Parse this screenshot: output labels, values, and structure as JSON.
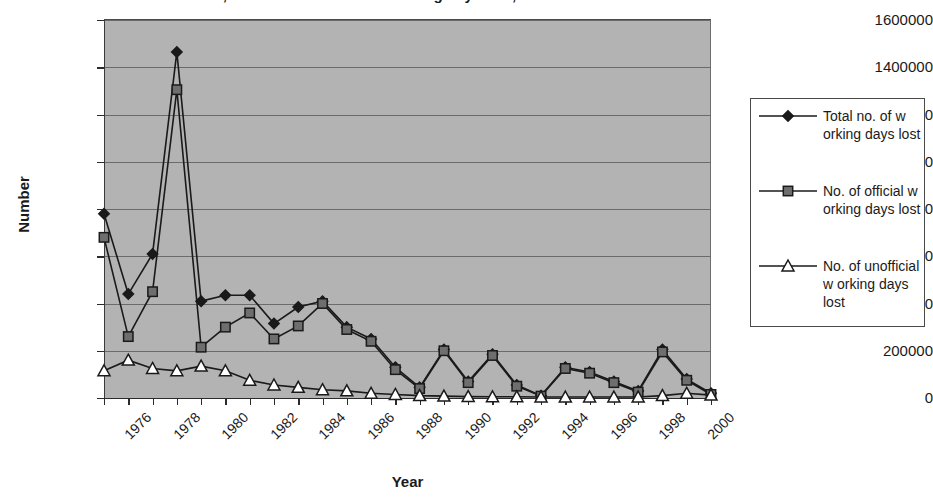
{
  "chart_data": {
    "type": "line",
    "title": "Total, official and unofficial working days lost, 1976-2001",
    "xlabel": "Year",
    "ylabel": "Number",
    "ylim": [
      0,
      1600000
    ],
    "ytick_labels": [
      "1600000",
      "1400000",
      "1200000",
      "1000000",
      "800000",
      "600000",
      "400000",
      "200000",
      "0"
    ],
    "ytick_values": [
      1600000,
      1400000,
      1200000,
      1000000,
      800000,
      600000,
      400000,
      200000,
      0
    ],
    "x": [
      1976,
      1977,
      1978,
      1979,
      1980,
      1981,
      1982,
      1983,
      1984,
      1985,
      1986,
      1987,
      1988,
      1989,
      1990,
      1991,
      1992,
      1993,
      1994,
      1995,
      1996,
      1997,
      1998,
      1999,
      2000,
      2001
    ],
    "xtick_labels": [
      "1976",
      "1978",
      "1980",
      "1982",
      "1984",
      "1986",
      "1988",
      "1990",
      "1992",
      "1994",
      "1996",
      "1998",
      "2000"
    ],
    "xtick_values": [
      1976,
      1978,
      1980,
      1982,
      1984,
      1986,
      1988,
      1990,
      1992,
      1994,
      1996,
      1998,
      2000
    ],
    "grid": true,
    "legend_position": "right",
    "plot_background": "#b3b3b3",
    "series": [
      {
        "name": "Total no. of working days lost",
        "marker": "diamond",
        "color": "#1a1a1a",
        "values": [
          780000,
          440000,
          610000,
          1465000,
          410000,
          435000,
          435000,
          315000,
          385000,
          410000,
          300000,
          250000,
          130000,
          45000,
          205000,
          70000,
          185000,
          55000,
          10000,
          130000,
          110000,
          70000,
          30000,
          205000,
          80000,
          20000
        ]
      },
      {
        "name": "No. of official working days lost",
        "marker": "square",
        "color": "#6e6e6e",
        "values": [
          680000,
          260000,
          450000,
          1305000,
          215000,
          300000,
          360000,
          250000,
          305000,
          400000,
          290000,
          240000,
          120000,
          40000,
          200000,
          65000,
          180000,
          50000,
          8000,
          125000,
          105000,
          65000,
          25000,
          195000,
          75000,
          15000
        ]
      },
      {
        "name": "No. of unofficial working days lost",
        "marker": "triangle",
        "color": "#ffffff",
        "values": [
          115000,
          160000,
          125000,
          115000,
          135000,
          115000,
          75000,
          55000,
          45000,
          35000,
          30000,
          20000,
          15000,
          10000,
          8000,
          6000,
          5000,
          5000,
          4000,
          4000,
          4000,
          4000,
          4000,
          10000,
          20000,
          12000
        ]
      }
    ]
  },
  "legend": {
    "entries": [
      {
        "label": "Total no. of w orking days lost",
        "marker": "diamond-marker"
      },
      {
        "label": "No. of official w orking days lost",
        "marker": "square-marker"
      },
      {
        "label": "No. of unofficial w orking days lost",
        "marker": "triangle-marker"
      }
    ]
  }
}
